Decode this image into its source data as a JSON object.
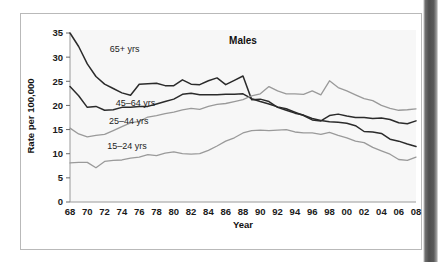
{
  "figure": {
    "title": "Males",
    "x_axis_title": "Year",
    "y_axis_title": "Rate per 100,000"
  },
  "chart_data": {
    "type": "line",
    "title": "Males",
    "xlabel": "Year",
    "ylabel": "Rate per 100,000",
    "xlim": [
      1968,
      2008
    ],
    "ylim": [
      0,
      35
    ],
    "grid": false,
    "legend": "inline-annotations",
    "x_tick_labels": [
      "68",
      "70",
      "72",
      "74",
      "76",
      "78",
      "80",
      "82",
      "84",
      "86",
      "88",
      "90",
      "92",
      "94",
      "96",
      "98",
      "00",
      "02",
      "04",
      "06",
      "08"
    ],
    "x_tick_values": [
      1968,
      1970,
      1972,
      1974,
      1976,
      1978,
      1980,
      1982,
      1984,
      1986,
      1988,
      1990,
      1992,
      1994,
      1996,
      1998,
      2000,
      2002,
      2004,
      2006,
      2008
    ],
    "y_tick_labels": [
      "0",
      "5",
      "10",
      "15",
      "20",
      "25",
      "30",
      "35"
    ],
    "y_tick_values": [
      0,
      5,
      10,
      15,
      20,
      25,
      30,
      35
    ],
    "x": [
      1968,
      1969,
      1970,
      1971,
      1972,
      1973,
      1974,
      1975,
      1976,
      1977,
      1978,
      1979,
      1980,
      1981,
      1982,
      1983,
      1984,
      1985,
      1986,
      1987,
      1988,
      1989,
      1990,
      1991,
      1992,
      1993,
      1994,
      1995,
      1996,
      1997,
      1998,
      1999,
      2000,
      2001,
      2002,
      2003,
      2004,
      2005,
      2006,
      2007,
      2008
    ],
    "series": [
      {
        "name": "65+ yrs",
        "label": "65+ yrs",
        "color": "#2b2b2b",
        "label_x": 1972.6,
        "label_y": 31.6,
        "values": [
          35.0,
          32.2,
          28.6,
          26.0,
          24.4,
          23.5,
          22.6,
          22.1,
          24.4,
          24.5,
          24.6,
          24.1,
          24.1,
          25.3,
          24.4,
          24.3,
          25.1,
          25.7,
          24.3,
          25.2,
          26.1,
          21.2,
          21.3,
          20.8,
          19.6,
          19.0,
          18.4,
          18.0,
          17.3,
          16.9,
          16.6,
          16.5,
          16.3,
          15.8,
          14.6,
          14.5,
          14.2,
          13.0,
          12.6,
          12.0,
          11.5
        ]
      },
      {
        "name": "45-64 yrs",
        "label": "45–64 yrs",
        "color": "#2b2b2b",
        "label_x": 1973.3,
        "label_y": 20.6,
        "values": [
          23.9,
          22.0,
          19.6,
          19.8,
          19.0,
          19.1,
          19.6,
          19.6,
          19.8,
          19.8,
          20.3,
          20.8,
          21.3,
          22.3,
          22.5,
          22.2,
          22.2,
          22.2,
          22.3,
          22.3,
          22.4,
          21.4,
          20.8,
          20.3,
          19.7,
          19.3,
          18.6,
          17.9,
          17.0,
          16.8,
          17.9,
          18.2,
          17.8,
          17.5,
          17.5,
          17.3,
          17.4,
          17.1,
          16.4,
          16.2,
          16.8
        ]
      },
      {
        "name": "25-44 yrs",
        "label": "25–44 yrs",
        "color": "#9a9a9a",
        "label_x": 1972.5,
        "label_y": 16.8,
        "values": [
          15.3,
          14.1,
          13.5,
          13.8,
          14.0,
          14.8,
          15.6,
          16.4,
          16.7,
          17.6,
          17.9,
          18.3,
          18.6,
          19.1,
          19.4,
          19.2,
          19.8,
          20.2,
          20.4,
          20.8,
          21.2,
          22.0,
          22.4,
          23.9,
          23.0,
          22.4,
          22.4,
          22.3,
          23.0,
          22.2,
          25.1,
          23.7,
          23.0,
          22.2,
          21.4,
          21.0,
          20.0,
          19.4,
          19.0,
          19.1,
          19.3
        ]
      },
      {
        "name": "15-24 yrs",
        "label": "15–24 yrs",
        "color": "#9a9a9a",
        "label_x": 1972.3,
        "label_y": 11.6,
        "values": [
          8.1,
          8.2,
          8.2,
          7.1,
          8.4,
          8.6,
          8.7,
          9.1,
          9.3,
          9.8,
          9.6,
          10.1,
          10.4,
          10.0,
          9.9,
          10.0,
          10.7,
          11.6,
          12.6,
          13.3,
          14.3,
          14.8,
          14.9,
          14.8,
          14.9,
          15.0,
          14.5,
          14.3,
          14.3,
          14.0,
          14.4,
          13.8,
          13.3,
          12.6,
          12.3,
          11.3,
          10.6,
          9.9,
          8.8,
          8.6,
          9.3
        ]
      }
    ]
  }
}
